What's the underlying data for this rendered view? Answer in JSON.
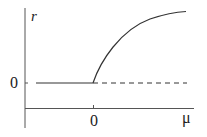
{
  "diagram": {
    "type": "bifurcation-diagram",
    "y_axis_label": "r",
    "x_axis_label": "μ",
    "y_tick_label": "0",
    "x_tick_label": "0",
    "branches": [
      {
        "name": "stable-zero-branch",
        "style": "solid",
        "domain": "μ < 0",
        "value": "r = 0"
      },
      {
        "name": "unstable-zero-branch",
        "style": "dashed",
        "domain": "μ > 0",
        "value": "r = 0"
      },
      {
        "name": "stable-nonzero-branch",
        "style": "solid",
        "domain": "μ > 0",
        "value": "r = √μ"
      }
    ],
    "colors": {
      "line": "#333333",
      "axis": "#555555"
    }
  }
}
